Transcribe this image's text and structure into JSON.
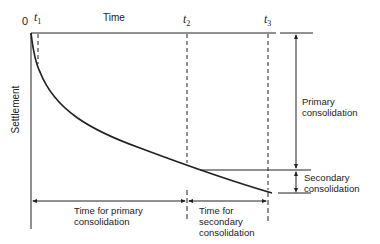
{
  "diagram": {
    "type": "settlement-time curve",
    "origin_label": "0",
    "x_axis_label": "Time",
    "y_axis_label": "Settlement",
    "time_markers": [
      {
        "symbol": "t",
        "sub": "1"
      },
      {
        "symbol": "t",
        "sub": "2"
      },
      {
        "symbol": "t",
        "sub": "3"
      }
    ],
    "right_annotations": {
      "primary": [
        "Primary",
        "consolidation"
      ],
      "secondary": [
        "Secondary",
        "consolidation"
      ]
    },
    "bottom_annotations": {
      "primary_time": [
        "Time for primary",
        "consolidation"
      ],
      "secondary_time": [
        "Time for",
        "secondary",
        "consolidation"
      ]
    },
    "colors": {
      "line": "#222222",
      "background": "#ffffff"
    }
  }
}
